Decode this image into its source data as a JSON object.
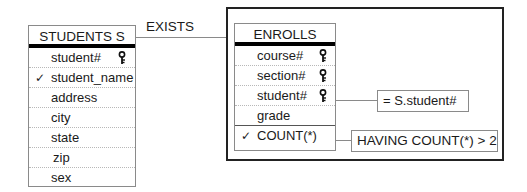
{
  "connector": {
    "label": "EXISTS"
  },
  "students": {
    "title": "STUDENTS  S",
    "rows": [
      {
        "name": "student#",
        "key": true,
        "checked": false
      },
      {
        "name": "student_name",
        "key": false,
        "checked": true
      },
      {
        "name": "address",
        "key": false,
        "checked": false
      },
      {
        "name": "city",
        "key": false,
        "checked": false
      },
      {
        "name": "state",
        "key": false,
        "checked": false
      },
      {
        "name": "zip",
        "key": false,
        "checked": false
      },
      {
        "name": "sex",
        "key": false,
        "checked": false
      }
    ]
  },
  "enrolls": {
    "title": "ENROLLS",
    "rows": [
      {
        "name": "course#",
        "key": true,
        "checked": false
      },
      {
        "name": "section#",
        "key": true,
        "checked": false
      },
      {
        "name": "student#",
        "key": true,
        "checked": false
      },
      {
        "name": "grade",
        "key": false,
        "checked": false
      },
      {
        "name": "COUNT(*)",
        "key": false,
        "checked": true
      }
    ]
  },
  "conditions": {
    "student_condition": "= S.student#",
    "having_condition": "HAVING COUNT(*) > 2"
  },
  "symbols": {
    "check": "✓"
  }
}
